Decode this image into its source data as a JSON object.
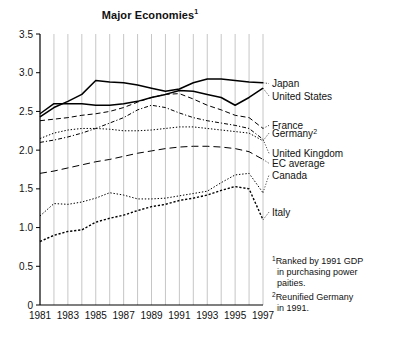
{
  "title": {
    "text": "Major Economies",
    "superscript": "1"
  },
  "footnotes": [
    {
      "marker": "1",
      "lines": [
        "Ranked by 1991 GDP",
        "in purchasing power",
        "paities."
      ]
    },
    {
      "marker": "2",
      "lines": [
        "Reunified Germany",
        "in 1991."
      ]
    }
  ],
  "chart_data": {
    "type": "line",
    "title": "Major Economies",
    "xlabel": "",
    "ylabel": "",
    "xlim": [
      1981,
      1997
    ],
    "ylim": [
      0,
      3.5
    ],
    "yticks": [
      "0",
      "0.5",
      "1.0",
      "1.5",
      "2.0",
      "2.5",
      "3.0",
      "3.5"
    ],
    "ytick_values": [
      0,
      0.5,
      1.0,
      1.5,
      2.0,
      2.5,
      3.0,
      3.5
    ],
    "xticks": [
      "1981",
      "1983",
      "1985",
      "1987",
      "1989",
      "1991",
      "1993",
      "1995",
      "1997"
    ],
    "xtick_values": [
      1981,
      1983,
      1985,
      1987,
      1989,
      1991,
      1993,
      1995,
      1997
    ],
    "x": [
      1981,
      1982,
      1983,
      1984,
      1985,
      1986,
      1987,
      1988,
      1989,
      1990,
      1991,
      1992,
      1993,
      1994,
      1995,
      1996,
      1997
    ],
    "grid": {
      "vertical": true,
      "horizontal": false
    },
    "legend_position": "right-inline",
    "series": [
      {
        "name": "Japan",
        "label": "Japan",
        "style": "solid",
        "color": "#000000",
        "label_y": 2.86,
        "values": [
          2.43,
          2.55,
          2.63,
          2.72,
          2.9,
          2.88,
          2.87,
          2.84,
          2.8,
          2.76,
          2.79,
          2.87,
          2.92,
          2.92,
          2.9,
          2.88,
          2.87
        ]
      },
      {
        "name": "United States",
        "label": "United States",
        "style": "solid",
        "color": "#000000",
        "label_y": 2.7,
        "values": [
          2.47,
          2.6,
          2.6,
          2.6,
          2.58,
          2.58,
          2.6,
          2.63,
          2.68,
          2.72,
          2.77,
          2.76,
          2.72,
          2.68,
          2.58,
          2.68,
          2.8
        ]
      },
      {
        "name": "France",
        "label": "France",
        "style": "dashed",
        "color": "#000000",
        "label_y": 2.32,
        "values": [
          2.38,
          2.4,
          2.42,
          2.45,
          2.47,
          2.5,
          2.55,
          2.62,
          2.68,
          2.72,
          2.73,
          2.66,
          2.58,
          2.52,
          2.45,
          2.42,
          2.28
        ]
      },
      {
        "name": "Germany",
        "label": "Germany",
        "superscript": "2",
        "style": "dotted",
        "color": "#000000",
        "label_y": 2.22,
        "values": [
          2.15,
          2.22,
          2.26,
          2.28,
          2.28,
          2.27,
          2.25,
          2.25,
          2.26,
          2.28,
          2.3,
          2.3,
          2.28,
          2.26,
          2.24,
          2.22,
          2.12
        ]
      },
      {
        "name": "United Kingdom",
        "label": "United Kingdom",
        "style": "dashdot",
        "color": "#000000",
        "label_y": 1.96,
        "values": [
          2.1,
          2.13,
          2.17,
          2.22,
          2.28,
          2.35,
          2.42,
          2.52,
          2.58,
          2.55,
          2.48,
          2.42,
          2.38,
          2.35,
          2.32,
          2.28,
          2.14
        ]
      },
      {
        "name": "EC average",
        "label": "EC average",
        "style": "longdash",
        "color": "#000000",
        "label_y": 1.83,
        "values": [
          1.7,
          1.73,
          1.77,
          1.81,
          1.85,
          1.88,
          1.92,
          1.96,
          1.99,
          2.02,
          2.04,
          2.05,
          2.05,
          2.04,
          2.02,
          1.98,
          1.88
        ]
      },
      {
        "name": "Canada",
        "label": "Canada",
        "style": "dotted",
        "color": "#000000",
        "label_y": 1.68,
        "values": [
          1.15,
          1.31,
          1.3,
          1.33,
          1.38,
          1.45,
          1.42,
          1.37,
          1.37,
          1.38,
          1.41,
          1.44,
          1.47,
          1.58,
          1.68,
          1.7,
          1.45
        ]
      },
      {
        "name": "Italy",
        "label": "Italy",
        "style": "densedot",
        "color": "#000000",
        "label_y": 1.2,
        "values": [
          0.82,
          0.9,
          0.95,
          0.97,
          1.07,
          1.12,
          1.16,
          1.22,
          1.27,
          1.3,
          1.35,
          1.38,
          1.42,
          1.48,
          1.53,
          1.5,
          1.1
        ]
      }
    ]
  }
}
